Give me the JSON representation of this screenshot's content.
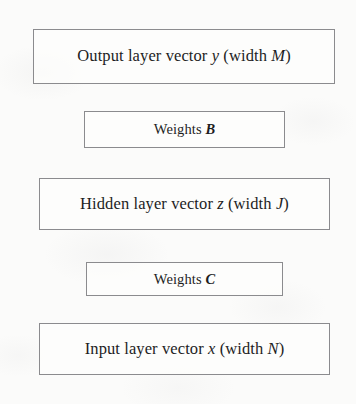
{
  "diagram": {
    "type": "stacked-block-diagram",
    "border_color": "#8b8b8e",
    "text_color": "#1d1d1f",
    "background_color": "#fbfbfa",
    "blocks": [
      {
        "id": "output-layer",
        "kind": "layer",
        "text_plain": "Output layer vector y (width M)",
        "prefix": "Output layer vector ",
        "variable": "y",
        "middle": " (width ",
        "dimension": "M",
        "suffix": ")"
      },
      {
        "id": "weights-b",
        "kind": "weights",
        "text_plain": "Weights B",
        "prefix": "Weights ",
        "variable": "B"
      },
      {
        "id": "hidden-layer",
        "kind": "layer",
        "text_plain": "Hidden layer vector z (width J)",
        "prefix": "Hidden layer vector ",
        "variable": "z",
        "middle": " (width ",
        "dimension": "J",
        "suffix": ")"
      },
      {
        "id": "weights-c",
        "kind": "weights",
        "text_plain": "Weights C",
        "prefix": "Weights ",
        "variable": "C"
      },
      {
        "id": "input-layer",
        "kind": "layer",
        "text_plain": "Input layer vector x (width N)",
        "prefix": "Input layer vector ",
        "variable": "x",
        "middle": " (width ",
        "dimension": "N",
        "suffix": ")"
      }
    ]
  }
}
